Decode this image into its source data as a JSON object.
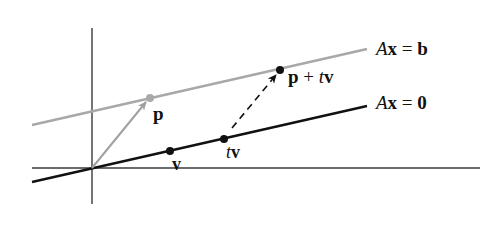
{
  "diagram": {
    "title": "",
    "colors": {
      "axes": "#3a3a3a",
      "homogeneous_line": "#111111",
      "solution_line": "#a8a8a8",
      "vector_p": "#a0a0a0",
      "translation_arrow": "#111111",
      "point_black": "#111111",
      "point_gray": "#a8a8a8"
    },
    "lines": {
      "solution": {
        "label_A": "A",
        "label_x": "x",
        "label_eq": " = ",
        "label_rhs": "b"
      },
      "homogeneous": {
        "label_A": "A",
        "label_x": "x",
        "label_eq": " = ",
        "label_rhs": "0"
      }
    },
    "points": {
      "p": {
        "label": "p"
      },
      "v": {
        "label": "v"
      },
      "tv": {
        "label_t": "t",
        "label_v": "v"
      },
      "p_plus_tv": {
        "label_p": "p",
        "label_plus": " + ",
        "label_t": "t",
        "label_v": "v"
      }
    }
  }
}
